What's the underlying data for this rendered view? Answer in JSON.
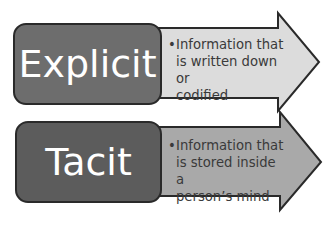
{
  "diagram": {
    "rows": [
      {
        "label": "Explicit",
        "bullet": "•",
        "description_lines": [
          "Information that",
          "is written down or",
          "codified"
        ],
        "box_color": "#6d6d6d",
        "arrow_color": "#dcdcdc"
      },
      {
        "label": "Tacit",
        "bullet": "•",
        "description_lines": [
          "Information that",
          "is stored inside a",
          "person’s mind"
        ],
        "box_color": "#5c5c5c",
        "arrow_color": "#a9a9a9"
      }
    ]
  }
}
